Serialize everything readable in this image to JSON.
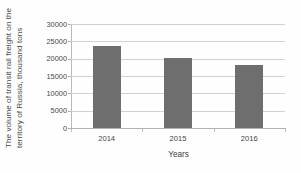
{
  "chart_data": {
    "type": "bar",
    "title": "",
    "subtitle": "",
    "xlabel": "Years",
    "ylabel": "The volume of transit rail freight on the territory of Russia, thousand tons",
    "categories": [
      "2014",
      "2015",
      "2016"
    ],
    "values": [
      23800,
      20100,
      18100
    ],
    "series": [
      {
        "name": "The volume of transit rail freight on the territory of Russia, thousand tons",
        "values": [
          23800,
          20100,
          18100
        ]
      }
    ],
    "ylim": [
      0,
      30000
    ],
    "ytick_labels": [
      "30000",
      "25000",
      "20000",
      "15000",
      "10000",
      "5000",
      "0"
    ],
    "ytick_values": [
      30000,
      25000,
      20000,
      15000,
      10000,
      5000,
      0
    ],
    "grid": "horizontal",
    "legend": "none",
    "bar_color": "#6e6e6e",
    "gridline_color": "#d2d2d2",
    "axis_color": "#b0b0b0",
    "background_color": "#fefefe"
  }
}
